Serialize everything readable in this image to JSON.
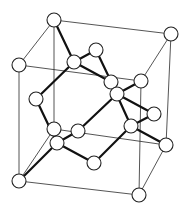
{
  "diagram": {
    "colors": {
      "background": "#ffffff",
      "line": "#111111",
      "atom_fill": "#ffffff"
    },
    "atom_radius": 7,
    "atoms": [
      {
        "id": "c_tbl",
        "kind": "corner",
        "x": 54,
        "y": 20
      },
      {
        "id": "c_tbr",
        "kind": "corner",
        "x": 171,
        "y": 34
      },
      {
        "id": "c_tfl",
        "kind": "corner",
        "x": 19,
        "y": 65
      },
      {
        "id": "c_tfr",
        "kind": "corner",
        "x": 141,
        "y": 81
      },
      {
        "id": "c_bbl",
        "kind": "corner",
        "x": 54,
        "y": 129
      },
      {
        "id": "c_bbr",
        "kind": "corner",
        "x": 166,
        "y": 145
      },
      {
        "id": "c_bfl",
        "kind": "corner",
        "x": 19,
        "y": 181
      },
      {
        "id": "c_bfr",
        "kind": "corner",
        "x": 139,
        "y": 195
      },
      {
        "id": "f_top",
        "kind": "face",
        "x": 96,
        "y": 50
      },
      {
        "id": "f_left",
        "kind": "face",
        "x": 36,
        "y": 99
      },
      {
        "id": "f_right",
        "kind": "face",
        "x": 154,
        "y": 114
      },
      {
        "id": "f_bottom",
        "kind": "face",
        "x": 94,
        "y": 163
      },
      {
        "id": "f_front",
        "kind": "face",
        "x": 78,
        "y": 131
      },
      {
        "id": "f_back",
        "kind": "face",
        "x": 111,
        "y": 82
      },
      {
        "id": "i_1",
        "kind": "interior",
        "x": 74,
        "y": 62
      },
      {
        "id": "i_2",
        "kind": "interior",
        "x": 117,
        "y": 94
      },
      {
        "id": "i_3",
        "kind": "interior",
        "x": 131,
        "y": 126
      },
      {
        "id": "i_4",
        "kind": "interior",
        "x": 57,
        "y": 143
      }
    ],
    "cube_edges": [
      [
        "c_tbl",
        "c_tbr"
      ],
      [
        "c_tbr",
        "c_tfr"
      ],
      [
        "c_tfr",
        "c_tfl"
      ],
      [
        "c_tfl",
        "c_tbl"
      ],
      [
        "c_bbl",
        "c_bbr"
      ],
      [
        "c_bbr",
        "c_bfr"
      ],
      [
        "c_bfr",
        "c_bfl"
      ],
      [
        "c_bfl",
        "c_bbl"
      ],
      [
        "c_tbl",
        "c_bbl"
      ],
      [
        "c_tbr",
        "c_bbr"
      ],
      [
        "c_tfl",
        "c_bfl"
      ],
      [
        "c_tfr",
        "c_bfr"
      ]
    ],
    "bonds": [
      [
        "i_1",
        "c_tbl"
      ],
      [
        "i_1",
        "f_top"
      ],
      [
        "i_1",
        "f_left"
      ],
      [
        "i_1",
        "f_back"
      ],
      [
        "i_2",
        "c_tfr"
      ],
      [
        "i_2",
        "f_top"
      ],
      [
        "i_2",
        "f_front"
      ],
      [
        "i_2",
        "f_right"
      ],
      [
        "i_3",
        "c_bbr"
      ],
      [
        "i_3",
        "f_right"
      ],
      [
        "i_3",
        "f_bottom"
      ],
      [
        "i_3",
        "f_back"
      ],
      [
        "i_4",
        "c_bfl"
      ],
      [
        "i_4",
        "f_left"
      ],
      [
        "i_4",
        "f_front"
      ],
      [
        "i_4",
        "f_bottom"
      ]
    ]
  }
}
